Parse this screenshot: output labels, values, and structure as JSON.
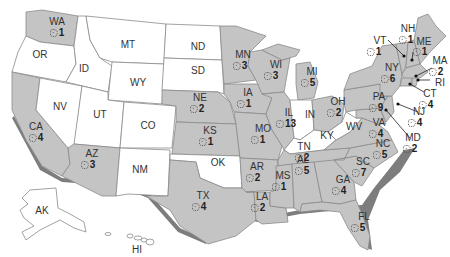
{
  "map": {
    "type": "choropleth-us-states",
    "highlight_color": "#c4c4c4",
    "default_color": "#ffffff",
    "icon": "gear-icon",
    "states": [
      {
        "abbr": "WA",
        "count": "1",
        "highlighted": true
      },
      {
        "abbr": "OR",
        "count": null,
        "highlighted": false
      },
      {
        "abbr": "CA",
        "count": "4",
        "highlighted": true
      },
      {
        "abbr": "NV",
        "count": null,
        "highlighted": false
      },
      {
        "abbr": "ID",
        "count": null,
        "highlighted": false
      },
      {
        "abbr": "MT",
        "count": null,
        "highlighted": false
      },
      {
        "abbr": "WY",
        "count": null,
        "highlighted": false
      },
      {
        "abbr": "UT",
        "count": null,
        "highlighted": false
      },
      {
        "abbr": "CO",
        "count": null,
        "highlighted": false
      },
      {
        "abbr": "AZ",
        "count": "3",
        "highlighted": true
      },
      {
        "abbr": "NM",
        "count": null,
        "highlighted": false
      },
      {
        "abbr": "ND",
        "count": null,
        "highlighted": false
      },
      {
        "abbr": "SD",
        "count": null,
        "highlighted": false
      },
      {
        "abbr": "NE",
        "count": "2",
        "highlighted": true
      },
      {
        "abbr": "KS",
        "count": "1",
        "highlighted": true
      },
      {
        "abbr": "OK",
        "count": null,
        "highlighted": false
      },
      {
        "abbr": "TX",
        "count": "4",
        "highlighted": true
      },
      {
        "abbr": "MN",
        "count": "3",
        "highlighted": true
      },
      {
        "abbr": "IA",
        "count": "1",
        "highlighted": true
      },
      {
        "abbr": "MO",
        "count": "1",
        "highlighted": true
      },
      {
        "abbr": "AR",
        "count": "2",
        "highlighted": true
      },
      {
        "abbr": "LA",
        "count": "2",
        "highlighted": true
      },
      {
        "abbr": "WI",
        "count": "3",
        "highlighted": true
      },
      {
        "abbr": "IL",
        "count": "13",
        "highlighted": true
      },
      {
        "abbr": "MI",
        "count": "5",
        "highlighted": true
      },
      {
        "abbr": "IN",
        "count": null,
        "highlighted": false
      },
      {
        "abbr": "OH",
        "count": "2",
        "highlighted": true
      },
      {
        "abbr": "KY",
        "count": null,
        "highlighted": false
      },
      {
        "abbr": "TN",
        "count": "2",
        "highlighted": true
      },
      {
        "abbr": "MS",
        "count": "1",
        "highlighted": true
      },
      {
        "abbr": "AL",
        "count": "5",
        "highlighted": true
      },
      {
        "abbr": "GA",
        "count": "4",
        "highlighted": true
      },
      {
        "abbr": "FL",
        "count": "5",
        "highlighted": true
      },
      {
        "abbr": "SC",
        "count": "7",
        "highlighted": true
      },
      {
        "abbr": "NC",
        "count": "5",
        "highlighted": true
      },
      {
        "abbr": "VA",
        "count": "4",
        "highlighted": true
      },
      {
        "abbr": "WV",
        "count": null,
        "highlighted": false
      },
      {
        "abbr": "PA",
        "count": "9",
        "highlighted": true
      },
      {
        "abbr": "NY",
        "count": "6",
        "highlighted": true
      },
      {
        "abbr": "VT",
        "count": "1",
        "highlighted": true
      },
      {
        "abbr": "NH",
        "count": "1",
        "highlighted": true
      },
      {
        "abbr": "ME",
        "count": "1",
        "highlighted": true
      },
      {
        "abbr": "MA",
        "count": "2",
        "highlighted": true
      },
      {
        "abbr": "RI",
        "count": null,
        "highlighted": true
      },
      {
        "abbr": "CT",
        "count": "4",
        "highlighted": true
      },
      {
        "abbr": "NJ",
        "count": "4",
        "highlighted": true
      },
      {
        "abbr": "MD",
        "count": "2",
        "highlighted": true
      },
      {
        "abbr": "AK",
        "count": null,
        "highlighted": false
      },
      {
        "abbr": "HI",
        "count": null,
        "highlighted": false
      }
    ]
  },
  "labels": {
    "WA": "WA",
    "OR": "OR",
    "CA": "CA",
    "NV": "NV",
    "ID": "ID",
    "MT": "MT",
    "WY": "WY",
    "UT": "UT",
    "CO": "CO",
    "AZ": "AZ",
    "NM": "NM",
    "ND": "ND",
    "SD": "SD",
    "NE": "NE",
    "KS": "KS",
    "OK": "OK",
    "TX": "TX",
    "MN": "MN",
    "IA": "IA",
    "MO": "MO",
    "AR": "AR",
    "LA": "LA",
    "WI": "WI",
    "IL": "IL",
    "MI": "MI",
    "IN": "IN",
    "OH": "OH",
    "KY": "KY",
    "TN": "TN",
    "MS": "MS",
    "AL": "AL",
    "GA": "GA",
    "FL": "FL",
    "SC": "SC",
    "NC": "NC",
    "VA": "VA",
    "WV": "WV",
    "PA": "PA",
    "NY": "NY",
    "VT": "VT",
    "NH": "NH",
    "ME": "ME",
    "MA": "MA",
    "RI": "RI",
    "CT": "CT",
    "NJ": "NJ",
    "MD": "MD",
    "AK": "AK",
    "HI": "HI"
  },
  "counts": {
    "WA": "1",
    "CA": "4",
    "AZ": "3",
    "NE": "2",
    "KS": "1",
    "TX": "4",
    "MN": "3",
    "IA": "1",
    "MO": "1",
    "AR": "2",
    "LA": "2",
    "WI": "3",
    "IL": "13",
    "MI": "5",
    "OH": "2",
    "TN": "2",
    "MS": "1",
    "AL": "5",
    "GA": "4",
    "FL": "5",
    "SC": "7",
    "NC": "5",
    "VA": "4",
    "PA": "9",
    "NY": "6",
    "VT": "1",
    "NH": "1",
    "ME": "1",
    "MA": "2",
    "CT": "4",
    "NJ": "4",
    "MD": "2"
  }
}
